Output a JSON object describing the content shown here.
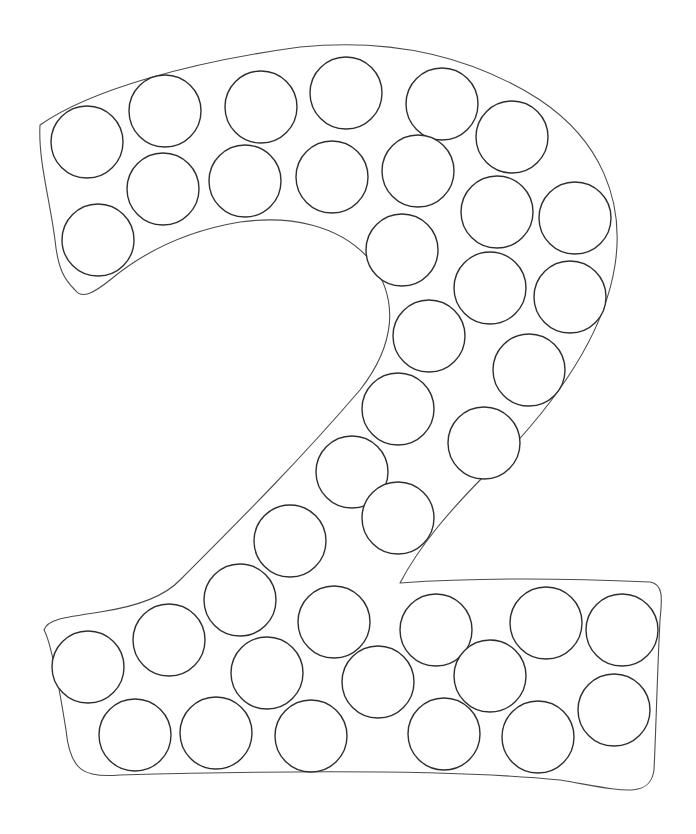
{
  "page": {
    "title": "Number 2 dot marker coloring page",
    "numeral": "2"
  },
  "colors": {
    "background": "#ffffff",
    "outline_stroke": "#4a4a4a",
    "dot_stroke": "#2e2e2e"
  },
  "outline": {
    "path": "M 40 125 C 90 90, 190 62, 300 47 C 390 38, 470 55, 540 100 C 600 140, 625 200, 615 265 C 605 330, 560 400, 490 470 C 450 510, 420 545, 400 583 C 470 578, 560 578, 650 582 C 664 584, 662 600, 660 620 C 657 680, 656 730, 654 770 C 650 800, 620 790, 560 780 C 460 770, 300 770, 120 775 C 85 778, 70 772, 66 730 C 58 680, 50 640, 44 630 C 47 620, 60 618, 100 612 C 140 606, 165 596, 180 580 C 240 520, 300 460, 360 390 C 395 345, 400 300, 370 260 C 340 225, 290 215, 240 222 C 180 232, 140 255, 110 280 C 95 292, 82 300, 75 290 C 65 280, 58 270, 55 240 C 50 200, 38 160, 40 125 Z"
  },
  "dots": {
    "radius": 36,
    "items": [
      {
        "cx": 87,
        "cy": 142
      },
      {
        "cx": 165,
        "cy": 111
      },
      {
        "cx": 261,
        "cy": 107
      },
      {
        "cx": 346,
        "cy": 93
      },
      {
        "cx": 442,
        "cy": 104
      },
      {
        "cx": 512,
        "cy": 137
      },
      {
        "cx": 163,
        "cy": 189
      },
      {
        "cx": 245,
        "cy": 181
      },
      {
        "cx": 332,
        "cy": 177
      },
      {
        "cx": 418,
        "cy": 171
      },
      {
        "cx": 98,
        "cy": 240
      },
      {
        "cx": 497,
        "cy": 212
      },
      {
        "cx": 575,
        "cy": 218
      },
      {
        "cx": 402,
        "cy": 250
      },
      {
        "cx": 490,
        "cy": 288
      },
      {
        "cx": 570,
        "cy": 297
      },
      {
        "cx": 429,
        "cy": 336
      },
      {
        "cx": 529,
        "cy": 370
      },
      {
        "cx": 398,
        "cy": 409
      },
      {
        "cx": 484,
        "cy": 443
      },
      {
        "cx": 352,
        "cy": 472
      },
      {
        "cx": 398,
        "cy": 518
      },
      {
        "cx": 290,
        "cy": 541
      },
      {
        "cx": 240,
        "cy": 600
      },
      {
        "cx": 169,
        "cy": 640
      },
      {
        "cx": 88,
        "cy": 667
      },
      {
        "cx": 334,
        "cy": 622
      },
      {
        "cx": 436,
        "cy": 630
      },
      {
        "cx": 546,
        "cy": 623
      },
      {
        "cx": 622,
        "cy": 630
      },
      {
        "cx": 267,
        "cy": 673
      },
      {
        "cx": 378,
        "cy": 682
      },
      {
        "cx": 490,
        "cy": 676
      },
      {
        "cx": 614,
        "cy": 710
      },
      {
        "cx": 135,
        "cy": 735
      },
      {
        "cx": 216,
        "cy": 733
      },
      {
        "cx": 311,
        "cy": 736
      },
      {
        "cx": 444,
        "cy": 734
      },
      {
        "cx": 538,
        "cy": 737
      }
    ]
  }
}
